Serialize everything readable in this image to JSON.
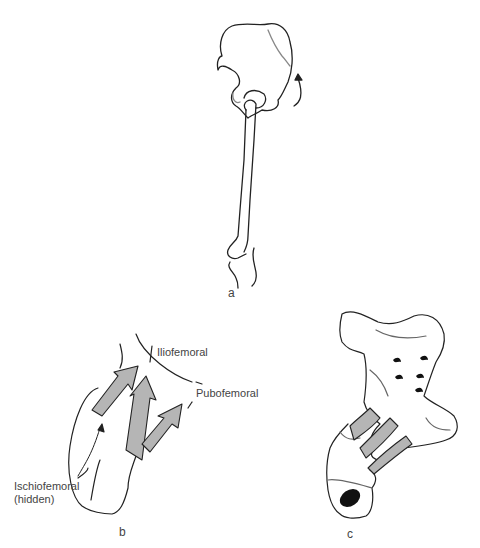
{
  "figure": {
    "panels": [
      {
        "id": "a",
        "label": "a"
      },
      {
        "id": "b",
        "label": "b",
        "annotations": {
          "iliofemoral": "Iliofemoral",
          "pubofemoral": "Pubofemoral",
          "ischiofemoral_line1": "Ischiofemoral",
          "ischiofemoral_line2": "(hidden)"
        }
      },
      {
        "id": "c",
        "label": "c"
      }
    ],
    "colors": {
      "line": "#222222",
      "ligament_fill": "#b5b5b5",
      "background": "#ffffff",
      "canal_fill": "#111111"
    }
  }
}
